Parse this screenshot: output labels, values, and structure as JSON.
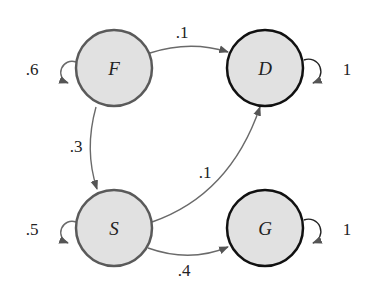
{
  "diagram": {
    "type": "markov-chain",
    "colors": {
      "node_fill": "#e1e1e1",
      "transient_stroke": "#5a5a5a",
      "absorbing_stroke": "#111111",
      "edge": "#6a6a6a"
    },
    "nodes": [
      {
        "id": "F",
        "label": "F",
        "kind": "transient",
        "self_loop": ".6"
      },
      {
        "id": "D",
        "label": "D",
        "kind": "absorbing",
        "self_loop": "1"
      },
      {
        "id": "S",
        "label": "S",
        "kind": "transient",
        "self_loop": ".5"
      },
      {
        "id": "G",
        "label": "G",
        "kind": "absorbing",
        "self_loop": "1"
      }
    ],
    "edges": [
      {
        "from": "F",
        "to": "D",
        "label": ".1"
      },
      {
        "from": "F",
        "to": "S",
        "label": ".3"
      },
      {
        "from": "S",
        "to": "D",
        "label": ".1"
      },
      {
        "from": "S",
        "to": "G",
        "label": ".4"
      }
    ]
  }
}
